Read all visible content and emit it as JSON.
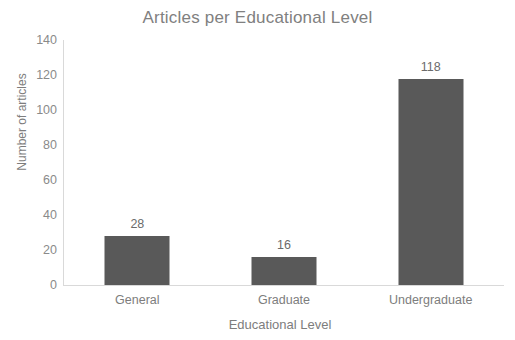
{
  "chart_data": {
    "type": "bar",
    "title": "Articles per Educational Level",
    "xlabel": "Educational Level",
    "ylabel": "Number of articles",
    "categories": [
      "General",
      "Graduate",
      "Undergraduate"
    ],
    "values": [
      28,
      16,
      118
    ],
    "ylim": [
      0,
      140
    ],
    "yticks": [
      140,
      120,
      100,
      80,
      60,
      40,
      20,
      0
    ],
    "grid": false,
    "legend": null,
    "bar_color": "#595959",
    "axis_color": "#d9d9d9",
    "title_color": "#808080",
    "label_color": "#7d7d7d",
    "data_labels": [
      "28",
      "16",
      "118"
    ]
  }
}
